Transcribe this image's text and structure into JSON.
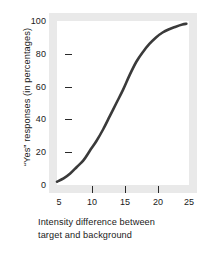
{
  "chart_data": {
    "type": "line",
    "title": "",
    "subtitle": "",
    "xlabel_line1": "Intensity difference between",
    "xlabel_line2": "target and background",
    "xlabel": "Intensity difference between target and background",
    "ylabel": "“Yes” responses (in percentages)",
    "xlim": [
      5,
      25
    ],
    "ylim": [
      0,
      100
    ],
    "xticks": [
      5,
      10,
      15,
      20,
      25
    ],
    "xtick_labels": [
      "5",
      "10",
      "15",
      "20",
      "25"
    ],
    "yticks": [
      0,
      20,
      40,
      60,
      80,
      100
    ],
    "ytick_labels": [
      "0",
      "20",
      "40",
      "60",
      "80",
      "100"
    ],
    "grid": false,
    "legend": "none",
    "series": [
      {
        "name": "Psychometric function",
        "color": "#3a3a3a",
        "line_width": 2.6,
        "x": [
          5.0,
          6.0,
          7.0,
          8.0,
          9.0,
          10.0,
          11.0,
          12.0,
          13.0,
          14.0,
          15.0,
          16.0,
          17.0,
          18.0,
          19.0,
          20.0,
          21.0,
          22.0,
          23.0,
          24.0,
          24.6
        ],
        "values": [
          2,
          4,
          7,
          11,
          15,
          21,
          27,
          34,
          42,
          50,
          58,
          67,
          75,
          81,
          86,
          90,
          93,
          95,
          96.5,
          97.8,
          98.3
        ]
      }
    ],
    "annotations": [],
    "colors": {
      "curve": "#3a3a3a",
      "plot_background": "#ffffff",
      "frame_band": "#e9e9e9",
      "text": "#1a1a1a",
      "tick_mark": "#2a2a2a",
      "figure_background": "#ffffff"
    }
  }
}
